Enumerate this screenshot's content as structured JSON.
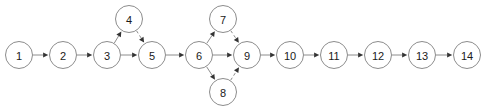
{
  "diagram": {
    "type": "directed-graph",
    "title": "",
    "background_color": "#ffffff",
    "node_stroke_color": "#8c8c8c",
    "node_fill_color": "#ffffff",
    "edge_color": "#8c8c8c",
    "arrowhead_color": "#333333",
    "label_color": "#1a1a1a",
    "node_radius": 13.5,
    "nodes": [
      {
        "id": "1",
        "label": "1",
        "cx": 19,
        "cy": 55
      },
      {
        "id": "2",
        "label": "2",
        "cx": 63,
        "cy": 55
      },
      {
        "id": "3",
        "label": "3",
        "cx": 107,
        "cy": 55
      },
      {
        "id": "4",
        "label": "4",
        "cx": 129,
        "cy": 19
      },
      {
        "id": "5",
        "label": "5",
        "cx": 152,
        "cy": 55
      },
      {
        "id": "6",
        "label": "6",
        "cx": 199,
        "cy": 55
      },
      {
        "id": "7",
        "label": "7",
        "cx": 223,
        "cy": 19
      },
      {
        "id": "8",
        "label": "8",
        "cx": 223,
        "cy": 92
      },
      {
        "id": "9",
        "label": "9",
        "cx": 247,
        "cy": 55
      },
      {
        "id": "10",
        "label": "10",
        "cx": 290,
        "cy": 55
      },
      {
        "id": "11",
        "label": "11",
        "cx": 334,
        "cy": 55
      },
      {
        "id": "12",
        "label": "12",
        "cx": 378,
        "cy": 55
      },
      {
        "id": "13",
        "label": "13",
        "cx": 422,
        "cy": 55
      },
      {
        "id": "14",
        "label": "14",
        "cx": 467,
        "cy": 55
      }
    ],
    "edges": [
      {
        "from": "1",
        "to": "2",
        "style": "solid"
      },
      {
        "from": "2",
        "to": "3",
        "style": "solid"
      },
      {
        "from": "3",
        "to": "4",
        "style": "solid"
      },
      {
        "from": "3",
        "to": "5",
        "style": "solid"
      },
      {
        "from": "4",
        "to": "5",
        "style": "dashed"
      },
      {
        "from": "5",
        "to": "6",
        "style": "solid"
      },
      {
        "from": "6",
        "to": "7",
        "style": "solid"
      },
      {
        "from": "6",
        "to": "9",
        "style": "solid"
      },
      {
        "from": "6",
        "to": "8",
        "style": "solid"
      },
      {
        "from": "7",
        "to": "9",
        "style": "dashed"
      },
      {
        "from": "8",
        "to": "9",
        "style": "dashed"
      },
      {
        "from": "9",
        "to": "10",
        "style": "solid"
      },
      {
        "from": "10",
        "to": "11",
        "style": "solid"
      },
      {
        "from": "11",
        "to": "12",
        "style": "solid"
      },
      {
        "from": "12",
        "to": "13",
        "style": "solid"
      },
      {
        "from": "13",
        "to": "14",
        "style": "solid"
      }
    ]
  }
}
